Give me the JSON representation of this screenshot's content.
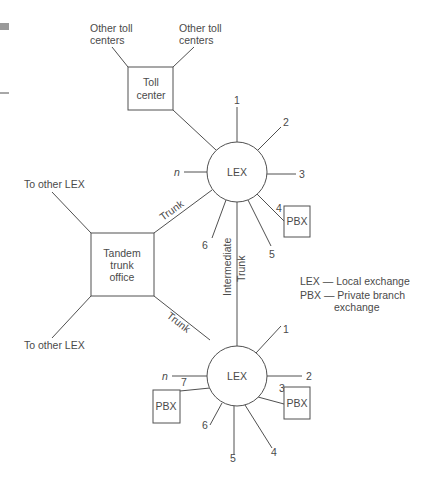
{
  "toll_center": {
    "label_line1": "Toll",
    "label_line2": "center",
    "other_left_line1": "Other toll",
    "other_left_line2": "centers",
    "other_right_line1": "Other toll",
    "other_right_line2": "centers"
  },
  "tandem": {
    "label_line1": "Tandem",
    "label_line2": "trunk",
    "label_line3": "office",
    "to_other_top": "To other LEX",
    "to_other_bottom": "To other LEX",
    "trunk_top": "Trunk",
    "trunk_bottom": "Trunk"
  },
  "lex_top": {
    "label": "LEX",
    "lines": [
      "1",
      "2",
      "3",
      "4",
      "5",
      "6",
      "n"
    ],
    "pbx_label": "PBX"
  },
  "intermediate": {
    "line1": "Intermediate",
    "line2": "Trunk"
  },
  "lex_bottom": {
    "label": "LEX",
    "lines": [
      "1",
      "2",
      "3",
      "4",
      "5",
      "6",
      "7",
      "n"
    ],
    "pbx_right_label": "PBX",
    "pbx_left_label": "PBX"
  },
  "legend": {
    "lex_line": "LEX — Local exchange",
    "pbx_line1": "PBX — Private branch",
    "pbx_line2": "exchange"
  }
}
